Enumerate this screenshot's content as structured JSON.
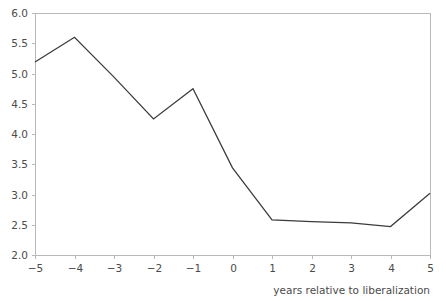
{
  "chart_data": {
    "type": "line",
    "title": "",
    "xlabel": "years relative to liberalization",
    "ylabel": "",
    "x": [
      -5,
      -4,
      -3,
      -2,
      -1,
      0,
      1,
      2,
      3,
      4,
      5
    ],
    "values": [
      5.19,
      5.6,
      4.94,
      4.25,
      4.75,
      3.44,
      2.58,
      2.55,
      2.53,
      2.47,
      3.02
    ],
    "series": [
      {
        "name": "",
        "values": [
          5.19,
          5.6,
          4.94,
          4.25,
          4.75,
          3.44,
          2.58,
          2.55,
          2.53,
          2.47,
          3.02
        ]
      }
    ],
    "xlim": [
      -5,
      5
    ],
    "ylim": [
      2.0,
      6.0
    ],
    "xticks": [
      -5,
      -4,
      -3,
      -2,
      -1,
      0,
      1,
      2,
      3,
      4,
      5
    ],
    "xtick_labels": [
      "−5",
      "−4",
      "−3",
      "−2",
      "−1",
      "0",
      "1",
      "2",
      "3",
      "4",
      "5"
    ],
    "yticks": [
      2.0,
      2.5,
      3.0,
      3.5,
      4.0,
      4.5,
      5.0,
      5.5,
      6.0
    ],
    "ytick_labels": [
      "2.0",
      "2.5",
      "3.0",
      "3.5",
      "4.0",
      "4.5",
      "5.0",
      "5.5",
      "6.0"
    ],
    "grid": false,
    "legend": null,
    "legend_position": "none",
    "line_color": "#3b3b3b",
    "axis_color": "#b9b9b9",
    "text_color": "#4b4b4b",
    "background_color": "#ffffff"
  },
  "geometry": {
    "plot_left": 35,
    "plot_right": 430,
    "plot_top": 13,
    "plot_bottom": 255
  }
}
